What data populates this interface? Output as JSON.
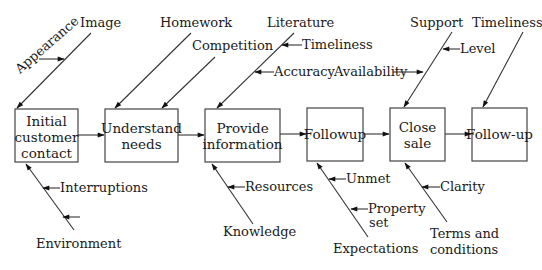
{
  "process_steps": [
    {
      "id": "initial",
      "lines": [
        "Initial",
        "customer",
        "contact"
      ]
    },
    {
      "id": "understand",
      "lines": [
        "Understand",
        "needs"
      ]
    },
    {
      "id": "provide",
      "lines": [
        "Provide",
        "information"
      ]
    },
    {
      "id": "followup",
      "lines": [
        "Followup"
      ]
    },
    {
      "id": "close",
      "lines": [
        "Close",
        "sale"
      ]
    },
    {
      "id": "followup2",
      "lines": [
        "Follow-up"
      ]
    }
  ],
  "causes": {
    "image": {
      "label": "Image",
      "sub": [
        "Appearance"
      ]
    },
    "homework": {
      "label": "Homework",
      "sub": []
    },
    "competition": {
      "label": "Competition",
      "sub": []
    },
    "literature": {
      "label": "Literature",
      "sub": [
        "Timeliness",
        "Accuracy"
      ]
    },
    "support": {
      "label": "Support",
      "sub": [
        "Level",
        "Availability"
      ]
    },
    "timeliness_top": {
      "label": "Timeliness",
      "sub": []
    },
    "environment": {
      "label": "Environment",
      "sub": [
        "Interruptions",
        ""
      ]
    },
    "knowledge": {
      "label": "Knowledge",
      "sub": [
        "Resources"
      ]
    },
    "expectations": {
      "label": "Expectations",
      "sub": [
        "Unmet",
        "Property set"
      ]
    },
    "terms": {
      "label_lines": [
        "Terms and",
        "conditions"
      ],
      "sub": [
        "Clarity"
      ]
    }
  },
  "labels": {
    "image": "Image",
    "appearance": "Appearance",
    "homework": "Homework",
    "competition": "Competition",
    "literature": "Literature",
    "timeliness_lit": "Timeliness",
    "accuracy": "Accuracy",
    "availability": "Availability",
    "support": "Support",
    "level": "Level",
    "timeliness_top": "Timeliness",
    "interruptions": "Interruptions",
    "environment": "Environment",
    "resources": "Resources",
    "knowledge": "Knowledge",
    "unmet": "Unmet",
    "property": "Property",
    "set": "set",
    "expectations": "Expectations",
    "clarity": "Clarity",
    "terms1": "Terms and",
    "terms2": "conditions",
    "box_initial_1": "Initial",
    "box_initial_2": "customer",
    "box_initial_3": "contact",
    "box_understand_1": "Understand",
    "box_understand_2": "needs",
    "box_provide_1": "Provide",
    "box_provide_2": "information",
    "box_followup": "Followup",
    "box_close_1": "Close",
    "box_close_2": "sale",
    "box_followup2": "Follow-up"
  },
  "colors": {
    "line": "#333333",
    "box_border": "#444444",
    "text": "#1a1a1a",
    "background": "#ffffff"
  }
}
